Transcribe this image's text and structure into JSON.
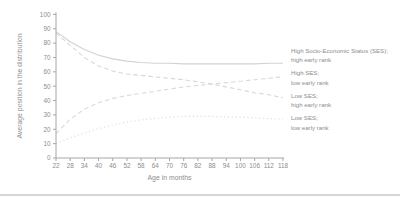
{
  "chart_data": {
    "type": "line",
    "title": "",
    "xlabel": "Age in months",
    "ylabel": "Average position in the distribution",
    "x": [
      22,
      28,
      34,
      40,
      46,
      52,
      58,
      64,
      70,
      76,
      82,
      88,
      94,
      100,
      106,
      112,
      118
    ],
    "xlim": [
      22,
      118
    ],
    "ylim": [
      0,
      100
    ],
    "yticks": [
      0,
      10,
      20,
      30,
      40,
      50,
      60,
      70,
      80,
      90,
      100
    ],
    "grid": false,
    "legend_position": "right",
    "colors": {
      "axis": "#a6a6a6",
      "tick_text": "#8d8d8d",
      "legend_text": "#8d8d8d"
    },
    "series": [
      {
        "id": "high-ses-high-early-rank",
        "name": "High Socio-Economic Status (SES); high early rank",
        "style": "solid",
        "color": "#d2d2d2",
        "values": [
          88,
          81,
          75.5,
          71.5,
          69,
          67.5,
          66.5,
          66,
          66,
          65.5,
          65.5,
          65.5,
          65.5,
          65.5,
          65.5,
          66,
          66
        ]
      },
      {
        "id": "high-ses-low-early-rank",
        "name": "High SES; low early rank",
        "style": "dashed",
        "color": "#dbdbdb",
        "values": [
          17,
          27,
          34,
          38.5,
          41.5,
          43.5,
          45,
          46.5,
          48,
          49.5,
          50.5,
          51.5,
          52.5,
          53.5,
          54.5,
          55.5,
          56.5
        ]
      },
      {
        "id": "low-ses-high-early-rank",
        "name": "Low SES; high early rank",
        "style": "dashed",
        "color": "#d8d8d8",
        "values": [
          87,
          78.5,
          70,
          64,
          60.5,
          58.5,
          57.5,
          56.5,
          55.5,
          54.5,
          53,
          51.5,
          49.5,
          47.5,
          45.5,
          44,
          42
        ]
      },
      {
        "id": "low-ses-low-early-rank",
        "name": "Low SES; low early rank",
        "style": "dotted",
        "color": "#dedede",
        "values": [
          10,
          14,
          17.5,
          20.5,
          23,
          25,
          26.5,
          27.5,
          28.5,
          29,
          29,
          29,
          28.5,
          28.5,
          28,
          27.5,
          27
        ]
      }
    ],
    "legend": {
      "entries": [
        {
          "line1": "High Socio-Economic Status (SES);",
          "line2": "high early rank"
        },
        {
          "line1": "High SES;",
          "line2": "low early rank"
        },
        {
          "line1": "Low SES;",
          "line2": "high early rank"
        },
        {
          "line1": "Low SES;",
          "line2": "low early rank"
        }
      ]
    }
  }
}
